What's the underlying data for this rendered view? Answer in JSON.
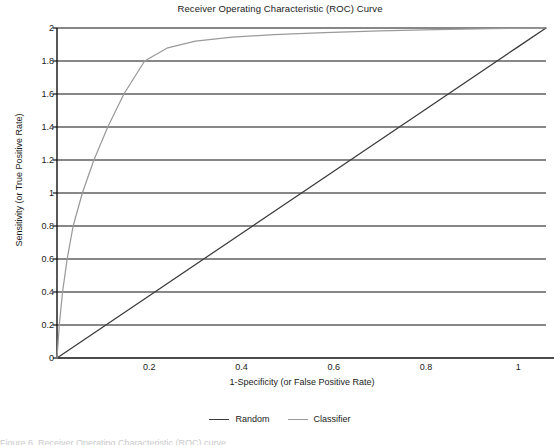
{
  "chart_data": {
    "type": "line",
    "title": "Receiver Operating Characteristic (ROC) Curve",
    "xlabel": "1-Specificity (or False Positive Rate)",
    "ylabel": "Sensitivity (or True Positive Rate)",
    "xlim": [
      0,
      1.06
    ],
    "ylim": [
      0,
      2
    ],
    "xticks": [
      "0.2",
      "0.4",
      "0.6",
      "0.8",
      "1"
    ],
    "xtick_values": [
      0.2,
      0.4,
      0.6,
      0.8,
      1
    ],
    "yticks": [
      "0",
      "0.2",
      "0.4",
      "0.6",
      "0.8",
      "1",
      "1.2",
      "1.4",
      "1.6",
      "1.8",
      "2"
    ],
    "ytick_values": [
      0,
      0.2,
      0.4,
      0.6,
      0.8,
      1,
      1.2,
      1.4,
      1.6,
      1.8,
      2
    ],
    "grid": "horizontal",
    "legend_position": "bottom-center",
    "series": [
      {
        "name": "Random",
        "color": "#3a3a3a",
        "x": [
          0,
          0.2,
          0.4,
          0.6,
          0.8,
          1.0,
          1.06
        ],
        "values": [
          0,
          0.377,
          0.755,
          1.132,
          1.509,
          1.887,
          2.0
        ]
      },
      {
        "name": "Classifier",
        "color": "#9a9a9a",
        "x": [
          0,
          0.005,
          0.012,
          0.022,
          0.035,
          0.055,
          0.08,
          0.11,
          0.145,
          0.19,
          0.24,
          0.3,
          0.38,
          0.47,
          0.58,
          0.7,
          0.82,
          0.94,
          1.06
        ],
        "values": [
          0,
          0.2,
          0.4,
          0.6,
          0.8,
          1.0,
          1.2,
          1.4,
          1.6,
          1.8,
          1.88,
          1.92,
          1.945,
          1.96,
          1.972,
          1.982,
          1.99,
          1.996,
          2.0
        ]
      }
    ]
  },
  "legend": {
    "items": [
      {
        "label": "Random",
        "color": "#3a3a3a"
      },
      {
        "label": "Classifier",
        "color": "#9a9a9a"
      }
    ]
  },
  "footer": {
    "cut_off_text": "Figure 6. Receiver Operating Characteristic (ROC) curve"
  }
}
